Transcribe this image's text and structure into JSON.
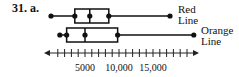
{
  "problem_label": "31. a.",
  "chart_data": {
    "type": "boxplot",
    "title": "",
    "xlabel": "",
    "ylabel": "",
    "axis": {
      "min": 0,
      "max": 22000,
      "tick_interval": 1000,
      "tick_labels": [
        {
          "value": 5000,
          "label": "5000"
        },
        {
          "value": 10000,
          "label": "10,000"
        },
        {
          "value": 15000,
          "label": "15,000"
        }
      ],
      "arrows": "both"
    },
    "series": [
      {
        "name": "Red Line",
        "label_lines": [
          "Red",
          "Line"
        ],
        "min": 0,
        "q1": 3500,
        "median": 5700,
        "q3": 8500,
        "max": 17500
      },
      {
        "name": "Orange Line",
        "label_lines": [
          "Orange",
          "Line"
        ],
        "min": 1300,
        "q1": 2300,
        "median": 5000,
        "q3": 9800,
        "max": 21000
      }
    ]
  }
}
